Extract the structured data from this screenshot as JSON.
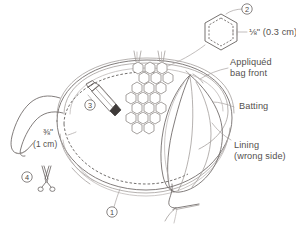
{
  "diagram": {
    "type": "sewing-instruction-illustration",
    "colors": {
      "line": "#6b6664",
      "line_light": "#9a9492",
      "text": "#54504e",
      "background": "#ffffff"
    }
  },
  "labels": {
    "hex_measure": "⅛\" (0.3 cm)",
    "appliqued_bag_front_line1": "Appliquéd",
    "appliqued_bag_front_line2": "bag front",
    "batting": "Batting",
    "lining_line1": "Lining",
    "lining_line2": "(wrong side)",
    "seam_measure_line1": "⅜\"",
    "seam_measure_line2": "(1 cm)"
  },
  "callouts": [
    {
      "id": "callout-1",
      "number": "1",
      "target": "bottom-seam-stitch-line"
    },
    {
      "id": "callout-2",
      "number": "2",
      "target": "hexagon-template-detail"
    },
    {
      "id": "callout-3",
      "number": "3",
      "target": "marking-pencil"
    },
    {
      "id": "callout-4",
      "number": "4",
      "target": "scissors"
    }
  ],
  "icons": {
    "pencil": "marking-pencil-icon",
    "scissors": "scissors-icon",
    "needle": "needle-and-thread-icon",
    "hexagon_template": "hexagon-template-icon"
  },
  "parts": {
    "bag_body": "bag-body",
    "strap": "bag-strap",
    "honeycomb": "honeycomb-applique-cluster",
    "lining_fold": "lining-folded-back",
    "batting_layer": "batting-layer",
    "stitch_line": "dashed-stitch-line"
  }
}
